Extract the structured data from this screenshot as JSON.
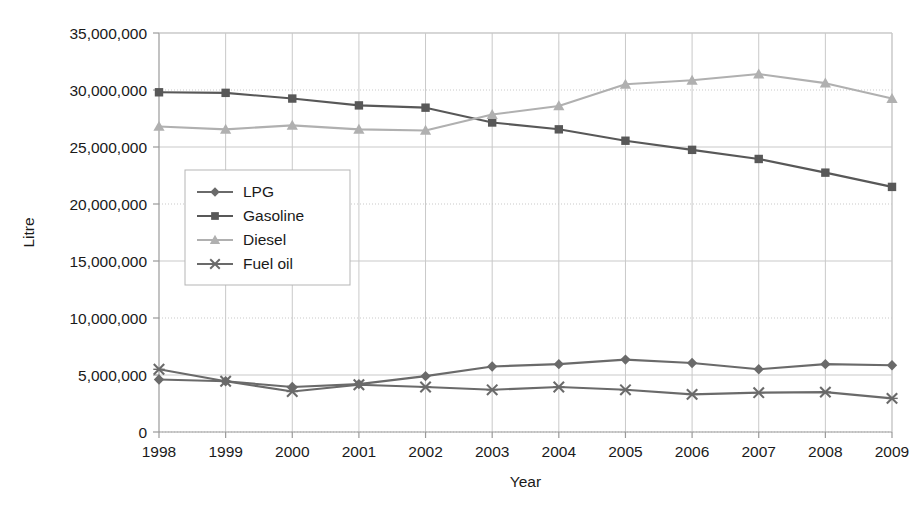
{
  "chart_data": {
    "type": "line",
    "title": "",
    "xlabel": "Year",
    "ylabel": "Litre",
    "categories": [
      "1998",
      "1999",
      "2000",
      "2001",
      "2002",
      "2003",
      "2004",
      "2005",
      "2006",
      "2007",
      "2008",
      "2009"
    ],
    "ylim": [
      0,
      35000000
    ],
    "ytick_labels": [
      "35,000,000",
      "30,000,000",
      "25,000,000",
      "20,000,000",
      "15,000,000",
      "10,000,000",
      "5,000,000",
      "0"
    ],
    "ytick_values": [
      35000000,
      30000000,
      25000000,
      20000000,
      15000000,
      10000000,
      5000000,
      0
    ],
    "grid": true,
    "legend_position": "inside-left",
    "series": [
      {
        "name": "LPG",
        "marker": "diamond",
        "color": "#6a6a6a",
        "values": [
          4600000,
          4450000,
          3950000,
          4200000,
          4900000,
          5750000,
          5950000,
          6350000,
          6050000,
          5500000,
          5950000,
          5850000
        ]
      },
      {
        "name": "Gasoline",
        "marker": "square",
        "color": "#585858",
        "values": [
          29800000,
          29750000,
          29250000,
          28650000,
          28450000,
          27150000,
          26550000,
          25550000,
          24750000,
          23950000,
          22750000,
          21500000
        ]
      },
      {
        "name": "Diesel",
        "marker": "triangle",
        "color": "#b0b0b0",
        "values": [
          26800000,
          26550000,
          26900000,
          26550000,
          26450000,
          27850000,
          28600000,
          30500000,
          30850000,
          31400000,
          30600000,
          29250000
        ]
      },
      {
        "name": "Fuel oil",
        "marker": "cross",
        "color": "#6a6a6a",
        "values": [
          5500000,
          4450000,
          3550000,
          4150000,
          3950000,
          3700000,
          3950000,
          3700000,
          3300000,
          3450000,
          3500000,
          2950000
        ]
      }
    ]
  }
}
